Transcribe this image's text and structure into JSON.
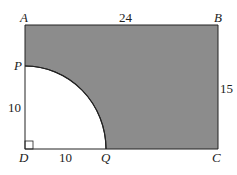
{
  "diagram": {
    "type": "geometry",
    "shape": "rectangle with quarter-circle removed",
    "fill_color": "#8c8c8c",
    "stroke_color": "#222222",
    "points": {
      "A": "A",
      "B": "B",
      "C": "C",
      "D": "D",
      "P": "P",
      "Q": "Q"
    },
    "lengths": {
      "AB": "24",
      "BC": "15",
      "DP": "10",
      "DQ": "10"
    }
  }
}
